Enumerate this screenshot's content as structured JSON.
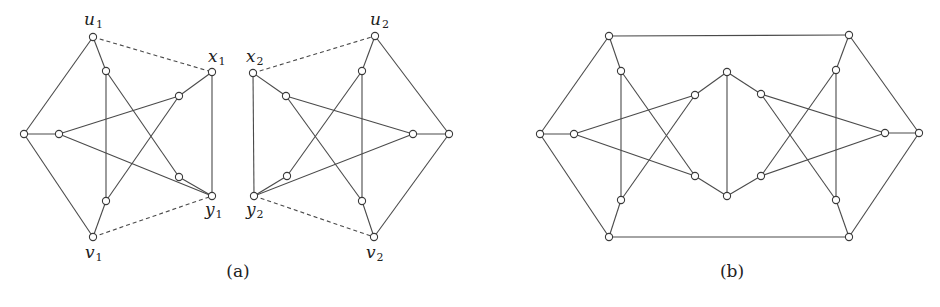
{
  "figure": {
    "panels": [
      {
        "id": "a",
        "caption": "(a)",
        "caption_pos": [
          238,
          277
        ],
        "labels": [
          {
            "main": "u",
            "sub": "1",
            "x": 84,
            "y": 25
          },
          {
            "main": "x",
            "sub": "1",
            "x": 208,
            "y": 62
          },
          {
            "main": "y",
            "sub": "1",
            "x": 205,
            "y": 215
          },
          {
            "main": "v",
            "sub": "1",
            "x": 85,
            "y": 258
          },
          {
            "main": "x",
            "sub": "2",
            "x": 246,
            "y": 62
          },
          {
            "main": "u",
            "sub": "2",
            "x": 370,
            "y": 25
          },
          {
            "main": "y",
            "sub": "2",
            "x": 246,
            "y": 215
          },
          {
            "main": "v",
            "sub": "2",
            "x": 366,
            "y": 258
          }
        ],
        "nodes": [
          [
            93,
            37
          ],
          [
            106,
            71
          ],
          [
            24,
            134
          ],
          [
            59,
            134
          ],
          [
            212,
            72
          ],
          [
            179,
            96
          ],
          [
            179,
            177
          ],
          [
            212,
            196
          ],
          [
            106,
            201
          ],
          [
            93,
            237
          ],
          [
            375,
            36
          ],
          [
            362,
            71
          ],
          [
            449,
            134
          ],
          [
            413,
            134
          ],
          [
            253,
            73
          ],
          [
            286,
            96
          ],
          [
            287,
            176
          ],
          [
            254,
            196
          ],
          [
            362,
            201
          ],
          [
            374,
            237
          ]
        ],
        "edges": [
          [
            0,
            2
          ],
          [
            2,
            9
          ],
          [
            2,
            3
          ],
          [
            0,
            1
          ],
          [
            1,
            8
          ],
          [
            8,
            9
          ],
          [
            1,
            6
          ],
          [
            3,
            5
          ],
          [
            3,
            7
          ],
          [
            8,
            5
          ],
          [
            5,
            4
          ],
          [
            6,
            7
          ],
          [
            4,
            7
          ],
          [
            10,
            12
          ],
          [
            12,
            19
          ],
          [
            12,
            13
          ],
          [
            10,
            11
          ],
          [
            11,
            18
          ],
          [
            18,
            19
          ],
          [
            11,
            16
          ],
          [
            13,
            15
          ],
          [
            13,
            17
          ],
          [
            18,
            15
          ],
          [
            15,
            14
          ],
          [
            16,
            17
          ],
          [
            14,
            17
          ]
        ],
        "dashed_edges": [
          [
            0,
            4
          ],
          [
            9,
            7
          ],
          [
            14,
            10
          ],
          [
            17,
            19
          ]
        ]
      },
      {
        "id": "b",
        "caption": "(b)",
        "caption_pos": [
          732,
          277
        ],
        "labels": [],
        "nodes": [
          [
            609,
            36
          ],
          [
            621,
            71
          ],
          [
            540,
            134
          ],
          [
            574,
            134
          ],
          [
            695,
            95
          ],
          [
            695,
            176
          ],
          [
            727,
            72
          ],
          [
            727,
            196
          ],
          [
            621,
            200
          ],
          [
            609,
            237
          ],
          [
            849,
            35
          ],
          [
            836,
            70
          ],
          [
            919,
            133
          ],
          [
            885,
            133
          ],
          [
            761,
            94
          ],
          [
            761,
            176
          ],
          [
            836,
            200
          ],
          [
            849,
            237
          ]
        ],
        "edges": [
          [
            0,
            2
          ],
          [
            2,
            9
          ],
          [
            2,
            3
          ],
          [
            0,
            1
          ],
          [
            1,
            8
          ],
          [
            8,
            9
          ],
          [
            1,
            5
          ],
          [
            3,
            4
          ],
          [
            3,
            5
          ],
          [
            8,
            4
          ],
          [
            4,
            6
          ],
          [
            5,
            7
          ],
          [
            6,
            7
          ],
          [
            10,
            12
          ],
          [
            12,
            17
          ],
          [
            12,
            13
          ],
          [
            10,
            11
          ],
          [
            11,
            16
          ],
          [
            16,
            17
          ],
          [
            11,
            15
          ],
          [
            13,
            14
          ],
          [
            13,
            15
          ],
          [
            16,
            14
          ],
          [
            14,
            6
          ],
          [
            15,
            7
          ],
          [
            0,
            10
          ],
          [
            9,
            17
          ]
        ],
        "dashed_edges": []
      }
    ]
  }
}
